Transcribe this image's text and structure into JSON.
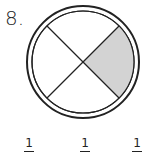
{
  "problem": {
    "number": "8.",
    "shape": "circle",
    "parts": 4,
    "shaded_parts": 1,
    "shade_color": "#d3d3d3",
    "answer_choices": [
      {
        "numerator": "1"
      },
      {
        "numerator": "1"
      },
      {
        "numerator": "1"
      }
    ]
  }
}
